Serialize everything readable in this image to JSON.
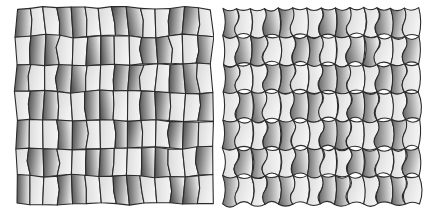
{
  "figure": {
    "background_color": "#ffffff",
    "width": 427,
    "height": 219,
    "panels": [
      {
        "name": "left-tiling",
        "label": "",
        "origin_x": 16,
        "origin_y": 8,
        "cols": 7,
        "rows": 7,
        "cell_w": 28,
        "cell_h": 28,
        "edge_style": "straight",
        "stroke_color": "#2b2b2b",
        "stroke_width": 1.1,
        "jitter": 2.0,
        "gradient_dark": "#555555",
        "gradient_light": "#f0f0f0",
        "gradient_dark_alt": "#6d6d6d",
        "gradient_light_alt": "#e6e6e6"
      },
      {
        "name": "right-tiling",
        "label": "",
        "origin_x": 10,
        "origin_y": 8,
        "cols": 7,
        "rows": 7,
        "cell_w": 28,
        "cell_h": 28,
        "edge_style": "curved",
        "stroke_color": "#2b2b2b",
        "stroke_width": 1.1,
        "jitter": 0.8,
        "gradient_dark": "#6a6a6a",
        "gradient_light": "#f2f2f2",
        "gradient_dark_alt": "#808080",
        "gradient_light_alt": "#ededed",
        "bulge": 5.0
      }
    ]
  },
  "chart_data": {
    "type": "other",
    "title": "",
    "subtitle": "",
    "xlabel": "",
    "ylabel": "",
    "legend": [],
    "annotations": [],
    "panel_count": 2,
    "panel_titles": [
      "",
      ""
    ],
    "tiling_left": {
      "cell_shape": "irregular pentagon / hexagon",
      "edges": "straight",
      "grid_columns": 7,
      "grid_rows": 7,
      "shading": "linear gradient dark-left to light-right",
      "tone_range": [
        "#555555",
        "#f0f0f0"
      ]
    },
    "tiling_right": {
      "cell_shape": "rounded bulging pentagon with concave notches",
      "edges": "curved",
      "grid_columns": 7,
      "grid_rows": 7,
      "shading": "linear gradient dark-left to light-right",
      "tone_range": [
        "#6a6a6a",
        "#f2f2f2"
      ]
    }
  }
}
